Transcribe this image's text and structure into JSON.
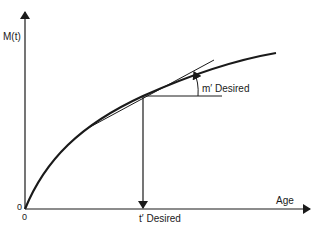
{
  "diagram": {
    "y_axis_label": "M(t)",
    "x_axis_label": "Age",
    "origin_y_label": "0",
    "origin_x_label": "0",
    "slope_label": "m′ Desired",
    "time_label": "t′ Desired",
    "curve_description": "concave increasing curve M(t) starting at origin",
    "tangent_description": "tangent line at point (t′, M(t′)) with slope m′",
    "colors": {
      "ink": "#1a1a1a",
      "background": "#ffffff"
    }
  }
}
